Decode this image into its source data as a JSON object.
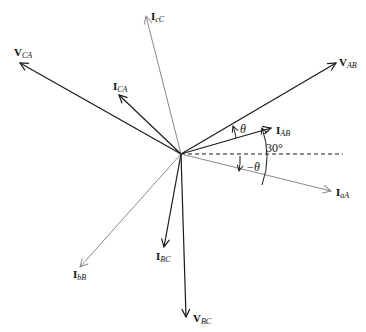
{
  "diagram": {
    "origin": {
      "x": 181,
      "y": 154
    },
    "reference_line": {
      "x2": 343,
      "style": "dashed"
    },
    "colors": {
      "dark": "#1a1a1a",
      "light": "#8a8a8a"
    },
    "phasors": [
      {
        "id": "V_AB",
        "main": "V",
        "sub": "AB",
        "tip": [
          336,
          63
        ],
        "label": [
          339,
          66
        ],
        "color": "dark",
        "width": 1.2
      },
      {
        "id": "I_AB",
        "main": "I",
        "sub": "AB",
        "tip": [
          271,
          128
        ],
        "label": [
          276,
          134
        ],
        "color": "dark",
        "width": 1.2
      },
      {
        "id": "I_aA",
        "main": "I",
        "sub": "aA",
        "tip": [
          331,
          191
        ],
        "label": [
          336,
          196
        ],
        "color": "light",
        "width": 1.0
      },
      {
        "id": "I_cC",
        "main": "I",
        "sub": "cC",
        "tip": [
          146,
          16
        ],
        "label": [
          151,
          20
        ],
        "color": "light",
        "width": 1.0
      },
      {
        "id": "V_CA",
        "main": "V",
        "sub": "CA",
        "tip": [
          20,
          63
        ],
        "label": [
          14,
          56
        ],
        "color": "dark",
        "width": 1.2
      },
      {
        "id": "I_CA",
        "main": "I",
        "sub": "CA",
        "tip": [
          119,
          95
        ],
        "label": [
          113,
          90
        ],
        "color": "dark",
        "width": 1.2
      },
      {
        "id": "I_BC",
        "main": "I",
        "sub": "BC",
        "tip": [
          164,
          247
        ],
        "label": [
          156,
          260
        ],
        "color": "dark",
        "width": 1.2
      },
      {
        "id": "I_bB",
        "main": "I",
        "sub": "bB",
        "tip": [
          80,
          267
        ],
        "label": [
          73,
          278
        ],
        "color": "light",
        "width": 1.0
      },
      {
        "id": "V_BC",
        "main": "V",
        "sub": "BC",
        "tip": [
          186,
          317
        ],
        "label": [
          193,
          322
        ],
        "color": "dark",
        "width": 1.2
      }
    ],
    "angles": {
      "theta": {
        "text": "θ",
        "pos": [
          240,
          133
        ]
      },
      "thirty": {
        "text": "30°",
        "pos": [
          262,
          152
        ]
      },
      "neg_theta": {
        "text": "−θ",
        "pos": [
          247,
          170
        ]
      }
    }
  }
}
